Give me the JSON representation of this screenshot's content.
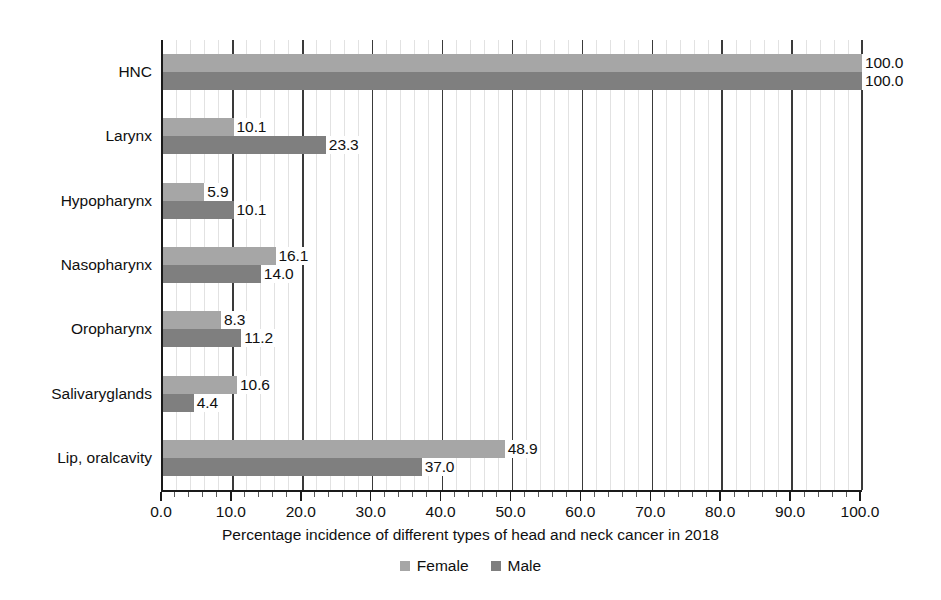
{
  "chart_data": {
    "type": "bar",
    "orientation": "horizontal",
    "title": "",
    "xlabel": "Percentage incidence of different types of head and neck cancer in 2018",
    "ylabel": "",
    "xlim": [
      0.0,
      100.0
    ],
    "xticks": [
      "0.0",
      "10.0",
      "20.0",
      "30.0",
      "40.0",
      "50.0",
      "60.0",
      "70.0",
      "80.0",
      "90.0",
      "100.0"
    ],
    "xtick_values": [
      0,
      10,
      20,
      30,
      40,
      50,
      60,
      70,
      80,
      90,
      100
    ],
    "grid": "vertical-major-and-minor",
    "legend_position": "bottom-center",
    "categories": [
      "HNC",
      "Larynx",
      "Hypopharynx",
      "Nasopharynx",
      "Oropharynx",
      "Salivaryglands",
      "Lip, oralcavity"
    ],
    "series": [
      {
        "name": "Female",
        "color": "#a6a6a6",
        "values": [
          100.0,
          10.1,
          5.9,
          16.1,
          8.3,
          10.6,
          48.9
        ],
        "labels": [
          "100.0",
          "10.1",
          "5.9",
          "16.1",
          "8.3",
          "10.6",
          "48.9"
        ]
      },
      {
        "name": "Male",
        "color": "#7f7f7f",
        "values": [
          100.0,
          23.3,
          10.1,
          14.0,
          11.2,
          4.4,
          37.0
        ],
        "labels": [
          "100.0",
          "23.3",
          "10.1",
          "14.0",
          "11.2",
          "4.4",
          "37.0"
        ]
      }
    ]
  },
  "legend": {
    "items": [
      {
        "label": "Female",
        "color": "#a6a6a6"
      },
      {
        "label": "Male",
        "color": "#7f7f7f"
      }
    ]
  },
  "axis": {
    "x_title": "Percentage incidence of different types of head and neck cancer in 2018"
  },
  "colors": {
    "female": "#a6a6a6",
    "male": "#7f7f7f",
    "axis": "#1a1a1a",
    "gridline_major": "#3a3a3a",
    "gridline_minor": "#e2e2e2",
    "text": "#101010",
    "background": "#ffffff"
  }
}
